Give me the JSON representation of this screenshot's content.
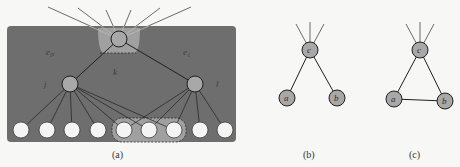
{
  "colors": {
    "background": "#f7f7f5",
    "panel": "#6e6e6e",
    "highlight": "#a0a0a0",
    "inner_node": "#a8a8a8",
    "leaf_node": "#f4f4f4",
    "edge": "#1e1e1e",
    "outer_edge": "#5a5a5a"
  },
  "panel_a": {
    "caption": "(a)",
    "labels": {
      "top_left_edge": "e_ij",
      "top_left_edge_display": "e₀ᵢ",
      "top_right_edge": "e_l",
      "top_right_edge_display": "e₁",
      "mid": "k",
      "left_node": "j",
      "right_node": "l"
    },
    "top_node": {
      "x": 119,
      "y": 39,
      "r": 8
    },
    "inner_nodes": [
      {
        "id": "j",
        "x": 70,
        "y": 84,
        "r": 8
      },
      {
        "id": "l",
        "x": 195,
        "y": 84,
        "r": 8
      }
    ],
    "leaves": [
      {
        "x": 21,
        "y": 130
      },
      {
        "x": 47,
        "y": 130
      },
      {
        "x": 72,
        "y": 130
      },
      {
        "x": 98,
        "y": 130
      },
      {
        "x": 124,
        "y": 130
      },
      {
        "x": 149,
        "y": 130
      },
      {
        "x": 174,
        "y": 130
      },
      {
        "x": 200,
        "y": 130
      },
      {
        "x": 225,
        "y": 130
      }
    ],
    "j_children": [
      0,
      1,
      2,
      3,
      4,
      5,
      6
    ],
    "l_children": [
      4,
      5,
      6,
      7,
      8
    ],
    "top_fan_targets": [
      {
        "x": 48,
        "y": 7
      },
      {
        "x": 78,
        "y": 8
      },
      {
        "x": 106,
        "y": 10
      },
      {
        "x": 131,
        "y": 10
      },
      {
        "x": 160,
        "y": 8
      },
      {
        "x": 191,
        "y": 7
      }
    ]
  },
  "panel_b": {
    "caption": "(b)",
    "nodes": {
      "c": "c",
      "a": "a",
      "b": "b"
    }
  },
  "panel_c": {
    "caption": "(c)",
    "nodes": {
      "c": "c",
      "a": "a",
      "b": "b"
    }
  }
}
